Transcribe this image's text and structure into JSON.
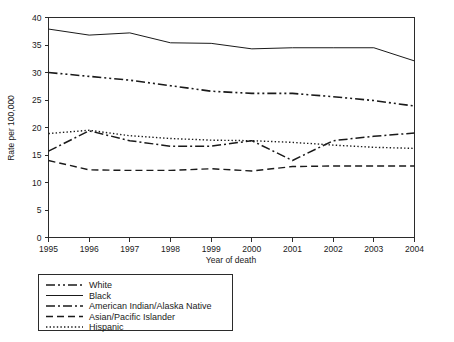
{
  "chart_data": {
    "type": "line",
    "title": "",
    "subtitle": "",
    "xlabel": "Year of death",
    "ylabel": "Rate per 100,000",
    "x": [
      1995,
      1996,
      1997,
      1998,
      1999,
      2000,
      2001,
      2002,
      2003,
      2004
    ],
    "xticklabels": [
      "1995",
      "1996",
      "1997",
      "1998",
      "1999",
      "2000",
      "2001",
      "2002",
      "2003",
      "2004"
    ],
    "yticklabels": [
      "0",
      "5",
      "10",
      "15",
      "20",
      "25",
      "30",
      "35",
      "40"
    ],
    "yticks": [
      0,
      5,
      10,
      15,
      20,
      25,
      30,
      35,
      40
    ],
    "xlim": [
      1995,
      2004
    ],
    "ylim": [
      0,
      40
    ],
    "grid": false,
    "legend_position": "below-plot",
    "series": [
      {
        "name": "White",
        "linestyle": "dash-dot-dot",
        "color": "#1a1a1a",
        "values": [
          30.0,
          29.3,
          28.6,
          27.6,
          26.6,
          26.2,
          26.2,
          25.6,
          24.9,
          23.9
        ]
      },
      {
        "name": "Black",
        "linestyle": "solid",
        "color": "#1a1a1a",
        "values": [
          37.9,
          36.8,
          37.2,
          35.4,
          35.3,
          34.3,
          34.5,
          34.5,
          34.5,
          32.1
        ]
      },
      {
        "name": "American Indian/Alaska Native",
        "linestyle": "dash-dot",
        "color": "#1a1a1a",
        "values": [
          15.7,
          19.4,
          17.6,
          16.6,
          16.6,
          17.6,
          14.0,
          17.6,
          18.4,
          19.0
        ]
      },
      {
        "name": "Asian/Pacific Islander",
        "linestyle": "dashed",
        "color": "#1a1a1a",
        "values": [
          14.0,
          12.3,
          12.2,
          12.2,
          12.5,
          12.1,
          12.9,
          13.0,
          13.0,
          13.0
        ]
      },
      {
        "name": "Hispanic",
        "linestyle": "dotted",
        "color": "#1a1a1a",
        "values": [
          18.9,
          19.5,
          18.5,
          18.0,
          17.7,
          17.6,
          17.3,
          16.8,
          16.4,
          16.2
        ]
      }
    ]
  },
  "axes": {
    "ylabel": "Rate per 100,000",
    "xlabel": "Year of death"
  },
  "legend": {
    "items": [
      {
        "label": "White",
        "style": "dash-dot-dot"
      },
      {
        "label": "Black",
        "style": "solid"
      },
      {
        "label": "American Indian/Alaska Native",
        "style": "dash-dot"
      },
      {
        "label": "Asian/Pacific Islander",
        "style": "dashed"
      },
      {
        "label": "Hispanic",
        "style": "dotted"
      }
    ]
  }
}
